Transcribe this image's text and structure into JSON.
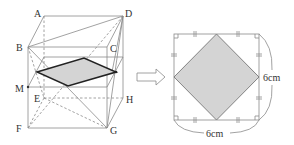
{
  "figure": {
    "left": {
      "title": "rectangular-prism-with-cross-section",
      "vertex_labels": {
        "A": "A",
        "B": "B",
        "C": "C",
        "D": "D",
        "E": "E",
        "F": "F",
        "G": "G",
        "H": "H",
        "M": "M"
      }
    },
    "arrow": "⇨",
    "right": {
      "title": "square-cross-section-view",
      "side_label": "6cm",
      "bottom_label": "6cm"
    },
    "colors": {
      "line": "#8a8a8a",
      "bold_line": "#222222",
      "shade": "#d4d4d4",
      "text": "#333333"
    }
  }
}
